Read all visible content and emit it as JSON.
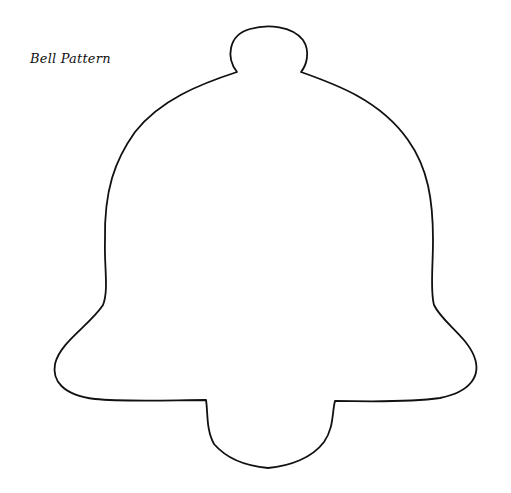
{
  "page": {
    "title": "Bell Pattern"
  },
  "figure": {
    "shape": "bell-outline",
    "stroke_color": "#111111",
    "background": "#ffffff"
  }
}
